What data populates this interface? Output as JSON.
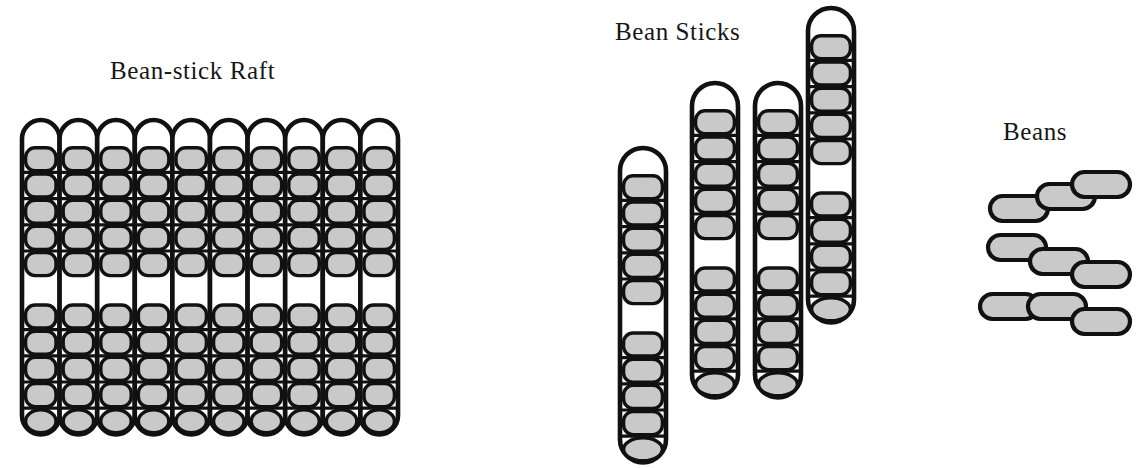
{
  "page": {
    "width": 1136,
    "height": 468,
    "background": "#ffffff",
    "ink": "#111111",
    "bean_fill": "#c9c9c9",
    "empty_fill": "#ffffff"
  },
  "labels": {
    "raft": "Bean-stick Raft",
    "sticks": "Bean Sticks",
    "beans": "Beans"
  },
  "legend": {
    "filled_cell": "bean",
    "empty_cell": "empty-slot"
  },
  "stick_pattern": {
    "cells": 12,
    "filled": [
      false,
      true,
      true,
      true,
      true,
      true,
      false,
      true,
      true,
      true,
      true,
      true
    ],
    "beans_per_stick": 10,
    "description": "empty cap, five beans, empty gap, five beans, empty cap"
  },
  "raft": {
    "columns": 10,
    "rows": 12,
    "x": 22,
    "y": 120,
    "col_width": 37.6,
    "cell_height": 26.2,
    "total_beans": 100,
    "sticks": [
      {
        "index": 1,
        "filled": [
          false,
          true,
          true,
          true,
          true,
          true,
          false,
          true,
          true,
          true,
          true,
          true
        ]
      },
      {
        "index": 2,
        "filled": [
          false,
          true,
          true,
          true,
          true,
          true,
          false,
          true,
          true,
          true,
          true,
          true
        ]
      },
      {
        "index": 3,
        "filled": [
          false,
          true,
          true,
          true,
          true,
          true,
          false,
          true,
          true,
          true,
          true,
          true
        ]
      },
      {
        "index": 4,
        "filled": [
          false,
          true,
          true,
          true,
          true,
          true,
          false,
          true,
          true,
          true,
          true,
          true
        ]
      },
      {
        "index": 5,
        "filled": [
          false,
          true,
          true,
          true,
          true,
          true,
          false,
          true,
          true,
          true,
          true,
          true
        ]
      },
      {
        "index": 6,
        "filled": [
          false,
          true,
          true,
          true,
          true,
          true,
          false,
          true,
          true,
          true,
          true,
          true
        ]
      },
      {
        "index": 7,
        "filled": [
          false,
          true,
          true,
          true,
          true,
          true,
          false,
          true,
          true,
          true,
          true,
          true
        ]
      },
      {
        "index": 8,
        "filled": [
          false,
          true,
          true,
          true,
          true,
          true,
          false,
          true,
          true,
          true,
          true,
          true
        ]
      },
      {
        "index": 9,
        "filled": [
          false,
          true,
          true,
          true,
          true,
          true,
          false,
          true,
          true,
          true,
          true,
          true
        ]
      },
      {
        "index": 10,
        "filled": [
          false,
          true,
          true,
          true,
          true,
          true,
          false,
          true,
          true,
          true,
          true,
          true
        ]
      }
    ]
  },
  "sticks": {
    "count": 4,
    "width": 46,
    "cell_height": 26.2,
    "items": [
      {
        "index": 1,
        "x": 620,
        "y": 148,
        "filled": [
          false,
          true,
          true,
          true,
          true,
          true,
          false,
          true,
          true,
          true,
          true,
          true
        ]
      },
      {
        "index": 2,
        "x": 692,
        "y": 83,
        "filled": [
          false,
          true,
          true,
          true,
          true,
          true,
          false,
          true,
          true,
          true,
          true,
          true
        ]
      },
      {
        "index": 3,
        "x": 755,
        "y": 83,
        "filled": [
          false,
          true,
          true,
          true,
          true,
          true,
          false,
          true,
          true,
          true,
          true,
          true
        ]
      },
      {
        "index": 4,
        "x": 808,
        "y": 8,
        "filled": [
          false,
          true,
          true,
          true,
          true,
          true,
          false,
          true,
          true,
          true,
          true,
          true
        ]
      }
    ]
  },
  "beans": {
    "count": 9,
    "rows": 3,
    "per_row": 3,
    "bean_width": 58,
    "bean_height": 25,
    "items": [
      {
        "row": 1,
        "col": 1,
        "x": 990,
        "y": 196
      },
      {
        "row": 1,
        "col": 2,
        "x": 1037,
        "y": 184
      },
      {
        "row": 1,
        "col": 3,
        "x": 1072,
        "y": 172
      },
      {
        "row": 2,
        "col": 1,
        "x": 988,
        "y": 235
      },
      {
        "row": 2,
        "col": 2,
        "x": 1030,
        "y": 249
      },
      {
        "row": 2,
        "col": 3,
        "x": 1072,
        "y": 262
      },
      {
        "row": 3,
        "col": 1,
        "x": 980,
        "y": 294
      },
      {
        "row": 3,
        "col": 2,
        "x": 1028,
        "y": 294
      },
      {
        "row": 3,
        "col": 3,
        "x": 1072,
        "y": 309
      }
    ]
  }
}
